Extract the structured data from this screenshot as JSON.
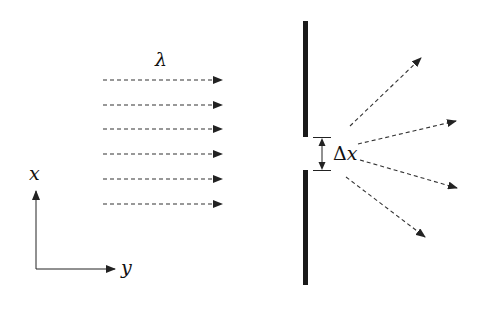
{
  "diagram": {
    "labels": {
      "wavelength": "λ",
      "slit_width": "Δx",
      "axis_x": "x",
      "axis_y": "y"
    },
    "incident_rays": {
      "count": 6,
      "x_start": 103,
      "x_end": 222,
      "y_positions": [
        80,
        105,
        129,
        154,
        179,
        204
      ],
      "style": "dashed",
      "color": "#333333"
    },
    "barrier": {
      "x": 305,
      "width": 5,
      "top_segment": [
        21,
        137
      ],
      "bottom_segment": [
        170,
        285
      ],
      "color": "#1a1a1a"
    },
    "slit_dimension": {
      "y_top": 137,
      "y_bottom": 170,
      "x": 322
    },
    "diffracted_rays": [
      {
        "from": [
          350,
          126
        ],
        "to": [
          421,
          58
        ]
      },
      {
        "from": [
          358,
          144
        ],
        "to": [
          456,
          121
        ]
      },
      {
        "from": [
          360,
          160
        ],
        "to": [
          457,
          188
        ]
      },
      {
        "from": [
          346,
          177
        ],
        "to": [
          425,
          237
        ]
      }
    ],
    "axes": {
      "origin": [
        36,
        269
      ],
      "x_end": [
        36,
        190
      ],
      "y_end": [
        115,
        269
      ]
    }
  }
}
